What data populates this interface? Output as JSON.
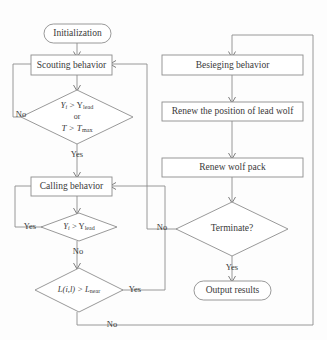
{
  "diagram": {
    "colors": {
      "stroke": "#8d8d8d",
      "text": "#3a3a3a",
      "background": "#fdfdfd",
      "shape_fill": "#ffffff"
    },
    "nodes": {
      "initialization": {
        "label": "Initialization",
        "shape": "terminator"
      },
      "scouting": {
        "label": "Scouting behavior",
        "shape": "process"
      },
      "decision_scout_line1": {
        "label": "Y",
        "sub1": "i",
        "op": " > Y",
        "sub2": "lead"
      },
      "decision_scout_line2": {
        "label": "or"
      },
      "decision_scout_line3": {
        "label": "T > T",
        "sub": "max"
      },
      "calling": {
        "label": "Calling behavior",
        "shape": "process"
      },
      "decision_calling": {
        "label": "Y",
        "sub1": "i",
        "op": " > Y",
        "sub2": "lead"
      },
      "decision_distance": {
        "label": "L(i,l) > L",
        "sub": "near"
      },
      "besieging": {
        "label": "Besieging behavior",
        "shape": "process"
      },
      "renew_lead": {
        "label": "Renew the position of lead wolf",
        "shape": "process"
      },
      "renew_pack": {
        "label": "Renew wolf pack",
        "shape": "process"
      },
      "terminate": {
        "label": "Terminate?",
        "shape": "decision"
      },
      "output": {
        "label": "Output results",
        "shape": "terminator"
      }
    },
    "edge_labels": {
      "scout_no": "No",
      "scout_yes": "Yes",
      "calling_yes": "Yes",
      "calling_no": "No",
      "distance_yes": "Yes",
      "distance_no": "No",
      "terminate_no": "No",
      "terminate_yes": "Yes"
    }
  }
}
